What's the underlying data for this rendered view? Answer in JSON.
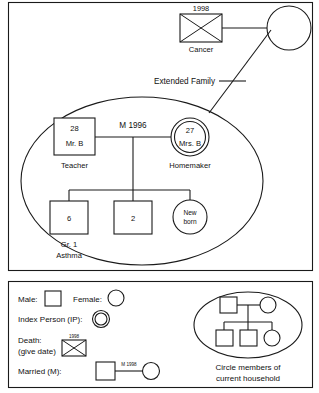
{
  "diagram": {
    "title_visible": false,
    "extended_family_label": "Extended Family",
    "deceased": {
      "date": "1998",
      "cause": "Cancer",
      "symbol": "deceased-male-square"
    },
    "grandmother": {
      "label": "",
      "symbol": "female-circle"
    },
    "father": {
      "age": "28",
      "name": "Mr. B",
      "role": "Teacher",
      "symbol": "male-square"
    },
    "mother": {
      "age": "27",
      "name": "Mrs. B",
      "role": "Homemaker",
      "symbol": "index-person-double-circle"
    },
    "marriage": {
      "label": "M 1996"
    },
    "children": [
      {
        "age": "6",
        "notes_line1": "Gr. 1",
        "notes_line2": "Asthma",
        "symbol": "male-square"
      },
      {
        "age": "2",
        "notes_line1": "",
        "notes_line2": "",
        "symbol": "male-square"
      },
      {
        "age_line1": "New",
        "age_line2": "born",
        "symbol": "female-circle"
      }
    ]
  },
  "legend": {
    "male_label": "Male:",
    "female_label": "Female:",
    "index_person_label": "Index Person (IP):",
    "death_label_line1": "Death:",
    "death_label_line2": "(give date)",
    "death_date": "1998",
    "married_label": "Married (M):",
    "married_date": "M 1998",
    "household_caption_line1": "Circle members of",
    "household_caption_line2": "current household"
  },
  "colors": {
    "ink": "#1a1a1a",
    "paper": "#ffffff"
  }
}
